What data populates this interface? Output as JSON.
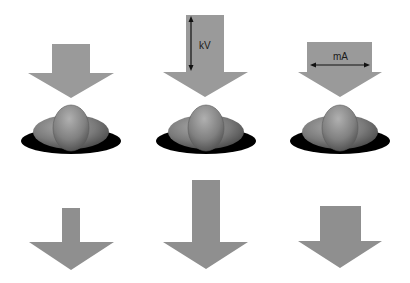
{
  "diagram": {
    "colors": {
      "arrow": "#9a9a9a",
      "arrow_bottom": "#8f8f8f",
      "shadow": "#000000",
      "organ": "#7d7d7d",
      "label_arrow": "#111111"
    },
    "columns": [
      {
        "id": "baseline",
        "label": ""
      },
      {
        "id": "kv",
        "label": "kV"
      },
      {
        "id": "ma",
        "label": "mA"
      }
    ],
    "labels": {
      "kv": "kV",
      "ma": "mA"
    }
  }
}
